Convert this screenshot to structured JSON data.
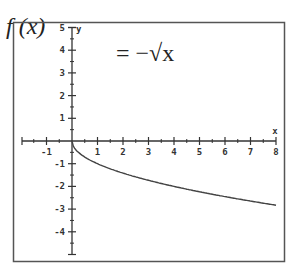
{
  "formula": {
    "lhs": "f (x)",
    "rhs": "= −√x"
  },
  "chart_data": {
    "type": "line",
    "xlabel": "x",
    "ylabel": "y",
    "xlim": [
      -2,
      8
    ],
    "ylim": [
      -5,
      5
    ],
    "x_ticks": [
      -1,
      1,
      2,
      3,
      4,
      5,
      6,
      7,
      8
    ],
    "y_ticks": [
      5,
      4,
      3,
      2,
      1,
      -1,
      -2,
      -3,
      -4
    ],
    "grid": false,
    "series": [
      {
        "name": "f(x) = -sqrt(x)",
        "x": [
          0,
          0.25,
          0.5,
          1,
          2,
          3,
          4,
          5,
          6,
          7,
          8
        ],
        "values": [
          0,
          -0.5,
          -0.71,
          -1,
          -1.41,
          -1.73,
          -2,
          -2.24,
          -2.45,
          -2.65,
          -2.83
        ]
      }
    ]
  },
  "colors": {
    "axis": "#333333",
    "curve": "#444444",
    "frame": "#555555"
  }
}
